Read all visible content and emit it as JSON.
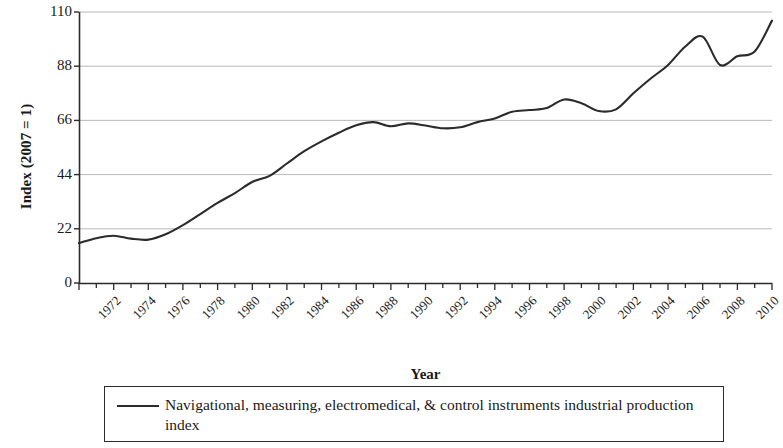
{
  "chart_data": {
    "type": "line",
    "title": "",
    "xlabel": "Year",
    "ylabel": "Index (2007 = 1)",
    "xlim": [
      1972,
      2012
    ],
    "ylim": [
      0,
      110
    ],
    "yticks": [
      0,
      22,
      44,
      66,
      88,
      110
    ],
    "xticks": [
      1972,
      1974,
      1976,
      1978,
      1980,
      1982,
      1984,
      1986,
      1988,
      1990,
      1992,
      1994,
      1996,
      1998,
      2000,
      2002,
      2004,
      2006,
      2008,
      2010,
      2012
    ],
    "x_minor_ticks_every": 1,
    "grid": "horizontal",
    "legend_position": "below",
    "line_color": "#2b2b2b",
    "series": [
      {
        "name": "Navigational, measuring, electromedical, & control instruments industrial production index",
        "x": [
          1972,
          1973,
          1974,
          1975,
          1976,
          1977,
          1978,
          1979,
          1980,
          1981,
          1982,
          1983,
          1984,
          1985,
          1986,
          1987,
          1988,
          1989,
          1990,
          1991,
          1992,
          1993,
          1994,
          1995,
          1996,
          1997,
          1998,
          1999,
          2000,
          2001,
          2002,
          2003,
          2004,
          2005,
          2006,
          2007,
          2008,
          2009,
          2010,
          2011,
          2012
        ],
        "values": [
          16.2,
          18.2,
          19.2,
          18.0,
          17.6,
          19.8,
          23.5,
          28.0,
          32.5,
          36.5,
          41.0,
          43.5,
          48.5,
          53.5,
          57.5,
          61.0,
          64.0,
          65.3,
          63.6,
          64.8,
          63.9,
          62.8,
          63.2,
          65.3,
          66.8,
          69.5,
          70.2,
          71.0,
          74.5,
          73.0,
          69.8,
          70.5,
          77.0,
          83.0,
          88.5,
          96.0,
          100.0,
          88.5,
          92.0,
          94.0,
          106.5
        ]
      }
    ]
  },
  "axis": {
    "ylabel": "Index (2007 = 1)",
    "xlabel": "Year"
  },
  "legend": {
    "entries": [
      {
        "marker": "line-dash",
        "label": "Navigational, measuring, electromedical, & control instruments industrial production index"
      }
    ]
  }
}
